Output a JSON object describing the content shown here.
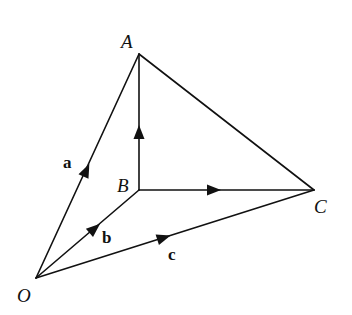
{
  "diagram": {
    "type": "vector-tetrahedron",
    "colors": {
      "line": "#111111",
      "background": "#ffffff"
    },
    "points": {
      "O": {
        "label": "O",
        "x": 36,
        "y": 278
      },
      "A": {
        "label": "A",
        "x": 139,
        "y": 54
      },
      "B": {
        "label": "B",
        "x": 139,
        "y": 190
      },
      "C": {
        "label": "C",
        "x": 314,
        "y": 190
      }
    },
    "edges": [
      {
        "from": "O",
        "to": "A",
        "arrow": true,
        "vector_label": "a"
      },
      {
        "from": "O",
        "to": "B",
        "arrow": true,
        "vector_label": "b"
      },
      {
        "from": "O",
        "to": "C",
        "arrow": true,
        "vector_label": "c"
      },
      {
        "from": "B",
        "to": "A",
        "arrow": true
      },
      {
        "from": "B",
        "to": "C",
        "arrow": true
      },
      {
        "from": "A",
        "to": "C",
        "arrow": false
      }
    ],
    "labels": {
      "vertex_A": "A",
      "vertex_B": "B",
      "vertex_C": "C",
      "vertex_O": "O",
      "vector_a": "a",
      "vector_b": "b",
      "vector_c": "c"
    }
  }
}
